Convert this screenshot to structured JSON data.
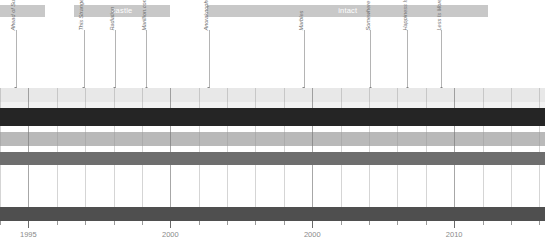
{
  "chart_data": {
    "type": "bar",
    "title": "",
    "xlabel": "",
    "ylabel": "",
    "xlim": [
      1994.0,
      2013.2
    ],
    "grid": true,
    "legend": "none",
    "axis": {
      "tick_values": [
        1995,
        2000,
        2005,
        2010
      ],
      "tick_labels": [
        "1995",
        "2000",
        "2000",
        "2010"
      ],
      "minor_step": 1
    },
    "groups": [
      {
        "label": "",
        "start": 1994.0,
        "end": 1995.6,
        "color": "#c8c8c8"
      },
      {
        "label": "castle",
        "start": 1996.6,
        "end": 2000.0,
        "color": "#c8c8c8"
      },
      {
        "label": "intact",
        "start": 2001.3,
        "end": 2011.2,
        "color": "#c8c8c8"
      }
    ],
    "annotations": [
      {
        "label": "Ahead of Sunlight",
        "x": 1994.55
      },
      {
        "label": "This Strange Engine",
        "x": 1996.95
      },
      {
        "label": "Radiation",
        "x": 1998.05
      },
      {
        "label": "Marillion.com",
        "x": 1999.15
      },
      {
        "label": "Anoraknophobia",
        "x": 2001.35
      },
      {
        "label": "Marbles",
        "x": 2004.7
      },
      {
        "label": "Somewhere Else",
        "x": 2007.05
      },
      {
        "label": "Happiness Is the Road",
        "x": 2008.35
      },
      {
        "label": "Less Is More",
        "x": 2009.55
      }
    ],
    "series": [
      {
        "name": "row-1",
        "color": "#e8e8e8",
        "start": 1994.0,
        "end": 2013.2
      },
      {
        "name": "row-2",
        "color": "#f2f2f2",
        "start": 1994.0,
        "end": 2013.2
      },
      {
        "name": "row-3",
        "color": "#252525",
        "start": 1994.0,
        "end": 2013.2
      },
      {
        "name": "row-4",
        "color": "#ffffff",
        "start": 1994.0,
        "end": 2013.2
      },
      {
        "name": "row-5",
        "color": "#b9b9b9",
        "start": 1994.0,
        "end": 2013.2
      },
      {
        "name": "row-6",
        "color": "#ffffff",
        "start": 1994.0,
        "end": 2013.2
      },
      {
        "name": "row-7",
        "color": "#6e6e6e",
        "start": 1994.0,
        "end": 2013.2
      },
      {
        "name": "row-8",
        "color": "#ffffff",
        "start": 1994.0,
        "end": 2013.2
      },
      {
        "name": "row-9",
        "color": "#4f4f4f",
        "start": 1994.0,
        "end": 2013.2
      }
    ],
    "row_geometry": [
      {
        "top": 88,
        "height": 14
      },
      {
        "top": 102,
        "height": 6
      },
      {
        "top": 108,
        "height": 18
      },
      {
        "top": 126,
        "height": 6
      },
      {
        "top": 132,
        "height": 14
      },
      {
        "top": 146,
        "height": 6
      },
      {
        "top": 152,
        "height": 13
      },
      {
        "top": 165,
        "height": 42
      },
      {
        "top": 207,
        "height": 14
      }
    ]
  }
}
